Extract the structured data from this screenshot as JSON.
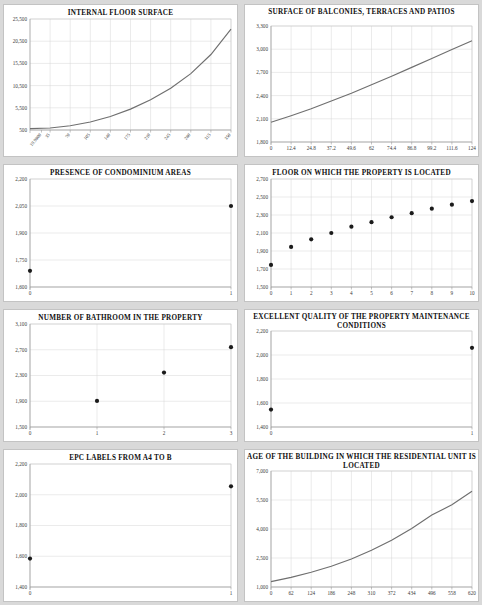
{
  "page": {
    "background_color": "#d9d9d9",
    "panel_color": "#ffffff",
    "curve_color": "#6f6f6f",
    "point_color": "#1b1b1b",
    "grid_color": "#d6d6d6"
  },
  "charts": [
    {
      "id": "internal-floor-surface",
      "title": "INTERNAL FLOOR SURFACE",
      "chart_data": {
        "type": "line",
        "title": "INTERNAL FLOOR SURFACE",
        "xlabel": "",
        "ylabel": "",
        "grid": true,
        "legend": "none",
        "xticklabels": [
          "19.9800",
          "35",
          "70",
          "105",
          "140",
          "175",
          "210",
          "245",
          "280",
          "315",
          "350"
        ],
        "yticklabels": [
          "500",
          "5,500",
          "10,500",
          "15,500",
          "20,500",
          "25,500"
        ],
        "ylim": [
          500,
          25500
        ],
        "xlim": [
          0,
          350
        ],
        "x": [
          0,
          35,
          70,
          105,
          140,
          175,
          210,
          245,
          280,
          315,
          350
        ],
        "y": [
          800,
          950,
          1450,
          2300,
          3550,
          5200,
          7300,
          9900,
          13200,
          17500,
          23200
        ]
      }
    },
    {
      "id": "surface-balconies-terraces-patios",
      "title": "SURFACE OF BALCONIES, TERRACES AND PATIOS",
      "chart_data": {
        "type": "line",
        "title": "SURFACE OF BALCONIES, TERRACES AND PATIOS",
        "xlabel": "",
        "ylabel": "",
        "grid": true,
        "legend": "none",
        "xticklabels": [
          "0",
          "12.4",
          "24.8",
          "37.2",
          "49.6",
          "62",
          "74.4",
          "86.8",
          "99.2",
          "111.6",
          "124"
        ],
        "yticklabels": [
          "1,800",
          "2,100",
          "2,400",
          "2,700",
          "3,000",
          "3,300"
        ],
        "ylim": [
          1800,
          3300
        ],
        "xlim": [
          0,
          124
        ],
        "x": [
          0,
          12.4,
          24.8,
          37.2,
          49.6,
          62,
          74.4,
          86.8,
          99.2,
          111.6,
          124
        ],
        "y": [
          2055,
          2140,
          2230,
          2330,
          2430,
          2540,
          2650,
          2765,
          2880,
          2995,
          3110
        ]
      }
    },
    {
      "id": "presence-of-condominium-areas",
      "title": "PRESENCE OF CONDOMINIUM AREAS",
      "chart_data": {
        "type": "scatter",
        "title": "PRESENCE OF CONDOMINIUM AREAS",
        "xlabel": "",
        "ylabel": "",
        "grid": true,
        "legend": "none",
        "xticklabels": [
          "0",
          "1"
        ],
        "yticklabels": [
          "1,600",
          "1,750",
          "1,900",
          "2,050",
          "2,200"
        ],
        "ylim": [
          1600,
          2200
        ],
        "xlim": [
          0,
          1
        ],
        "x": [
          0,
          1
        ],
        "y": [
          1690,
          2050
        ]
      }
    },
    {
      "id": "floor-on-which-the-property-is-located",
      "title": "FLOOR ON WHICH  THE PROPERTY IS LOCATED",
      "chart_data": {
        "type": "scatter",
        "title": "FLOOR ON WHICH  THE PROPERTY IS LOCATED",
        "xlabel": "",
        "ylabel": "",
        "grid": true,
        "legend": "none",
        "xticklabels": [
          "0",
          "1",
          "2",
          "3",
          "4",
          "5",
          "6",
          "7",
          "8",
          "9",
          "10"
        ],
        "yticklabels": [
          "1,500",
          "1,700",
          "1,900",
          "2,100",
          "2,300",
          "2,500",
          "2,700"
        ],
        "ylim": [
          1500,
          2700
        ],
        "xlim": [
          0,
          10
        ],
        "x": [
          0,
          1,
          2,
          3,
          4,
          5,
          6,
          7,
          8,
          9,
          10
        ],
        "y": [
          1745,
          1945,
          2030,
          2100,
          2170,
          2220,
          2275,
          2320,
          2370,
          2415,
          2455
        ]
      }
    },
    {
      "id": "number-of-bathroom-in-the-property",
      "title": "NUMBER OF BATHROOM IN THE PROPERTY",
      "chart_data": {
        "type": "scatter",
        "title": "NUMBER OF BATHROOM IN THE PROPERTY",
        "xlabel": "",
        "ylabel": "",
        "grid": true,
        "legend": "none",
        "xticklabels": [
          "0",
          "1",
          "2",
          "3"
        ],
        "yticklabels": [
          "1,500",
          "1,900",
          "2,300",
          "2,700",
          "3,100"
        ],
        "ylim": [
          1500,
          3100
        ],
        "xlim": [
          0,
          3
        ],
        "x": [
          1,
          2,
          3
        ],
        "y": [
          1905,
          2345,
          2740
        ]
      }
    },
    {
      "id": "excellent-quality-maintenance-conditions",
      "title": "EXCELLENT QUALITY OF THE PROPERTY MAINTENANCE CONDITIONS",
      "chart_data": {
        "type": "scatter",
        "title": "EXCELLENT QUALITY OF THE PROPERTY MAINTENANCE CONDITIONS",
        "xlabel": "",
        "ylabel": "",
        "grid": true,
        "legend": "none",
        "xticklabels": [
          "0",
          "1"
        ],
        "yticklabels": [
          "1,400",
          "1,600",
          "1,800",
          "2,000",
          "2,200"
        ],
        "ylim": [
          1400,
          2200
        ],
        "xlim": [
          0,
          1
        ],
        "x": [
          0,
          1
        ],
        "y": [
          1545,
          2060
        ]
      }
    },
    {
      "id": "epc-labels-from-a4-to-b",
      "title": "EPC LABELS FROM A4 TO B",
      "chart_data": {
        "type": "scatter",
        "title": "EPC LABELS FROM A4 TO B",
        "xlabel": "",
        "ylabel": "",
        "grid": true,
        "legend": "none",
        "xticklabels": [
          "0",
          "1"
        ],
        "yticklabels": [
          "1,400",
          "1,600",
          "1,800",
          "2,000",
          "2,200"
        ],
        "ylim": [
          1400,
          2200
        ],
        "xlim": [
          0,
          1
        ],
        "x": [
          0,
          1
        ],
        "y": [
          1585,
          2055
        ]
      }
    },
    {
      "id": "age-of-the-building",
      "title": "AGE OF THE BUILDING IN WHICH THE RESIDENTIAL UNIT IS LOCATED",
      "chart_data": {
        "type": "line",
        "title": "AGE OF THE BUILDING IN WHICH THE RESIDENTIAL UNIT IS LOCATED",
        "xlabel": "",
        "ylabel": "",
        "grid": true,
        "legend": "none",
        "xticklabels": [
          "0",
          "62",
          "124",
          "186",
          "248",
          "310",
          "372",
          "434",
          "496",
          "558",
          "620"
        ],
        "yticklabels": [
          "1,000",
          "2,500",
          "4,000",
          "5,500",
          "7,000"
        ],
        "ylim": [
          1000,
          7000
        ],
        "xlim": [
          0,
          620
        ],
        "x": [
          0,
          62,
          124,
          186,
          248,
          310,
          372,
          434,
          496,
          558,
          620
        ],
        "y": [
          1280,
          1500,
          1760,
          2070,
          2450,
          2900,
          3420,
          4030,
          4720,
          5250,
          5950
        ]
      }
    }
  ]
}
